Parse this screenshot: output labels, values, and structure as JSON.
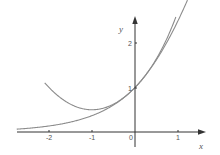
{
  "chart_data": {
    "type": "line",
    "title": "",
    "xlabel": "x",
    "ylabel": "y",
    "xlim": [
      -2.75,
      1.6
    ],
    "ylim": [
      -0.4,
      2.6
    ],
    "x_ticks": [
      -2,
      -1,
      0,
      1
    ],
    "x_tick_labels": [
      "-2",
      "-1",
      "0",
      "1"
    ],
    "y_ticks": [
      1,
      2
    ],
    "y_tick_labels": [
      "1",
      "2"
    ],
    "grid": false,
    "legend": null,
    "series": [
      {
        "name": "y = e^x",
        "x": [
          -2.75,
          -2.5,
          -2,
          -1.5,
          -1,
          -0.5,
          0,
          0.5,
          1,
          1.2
        ],
        "values": [
          0.064,
          0.082,
          0.135,
          0.223,
          0.368,
          0.607,
          1.0,
          1.649,
          2.718,
          3.32
        ]
      },
      {
        "name": "y = 1 + x + x^2/2",
        "x": [
          -2.75,
          -2.5,
          -2,
          -1.5,
          -1,
          -0.5,
          0,
          0.5,
          1,
          1.2
        ],
        "values": [
          1.03,
          1.625,
          1.0,
          0.625,
          0.5,
          0.625,
          1.0,
          1.625,
          2.5,
          2.92
        ]
      }
    ],
    "colors": {
      "curves": "#8a8a8a",
      "axes": "#333333"
    }
  },
  "labels": {
    "x_axis": "x",
    "y_axis": "y",
    "origin": "0",
    "xt_m2": "-2",
    "xt_m1": "-1",
    "xt_1": "1",
    "yt_1": "1",
    "yt_2": "2"
  }
}
